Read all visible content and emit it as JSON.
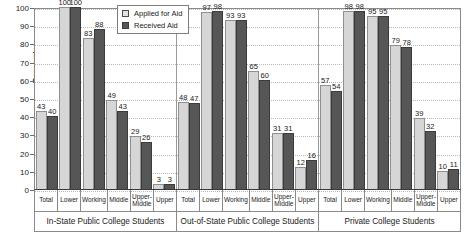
{
  "chart_data": {
    "type": "bar",
    "title": "",
    "xlabel": "",
    "ylabel": "Percent",
    "ylim": [
      0,
      100
    ],
    "ytick_labels": [
      "100",
      "90",
      "80",
      "70",
      "60",
      "50",
      "40",
      "30",
      "20",
      "10",
      "0"
    ],
    "ytick_values": [
      100,
      90,
      80,
      70,
      60,
      50,
      40,
      30,
      20,
      10,
      0
    ],
    "grid": true,
    "legend_position": "top-center",
    "legend": [
      "Applied for Aid",
      "Received Aid"
    ],
    "colors": {
      "applied": "#d6d6d6",
      "received": "#565656",
      "grid": "#b9b9b9",
      "axis": "#3a3a3a"
    },
    "categories": [
      "Total",
      "Lower",
      "Working",
      "Middle",
      "Upper-Middle",
      "Upper"
    ],
    "groups": [
      {
        "name": "In-State Public College Students",
        "series": [
          {
            "name": "Applied for Aid",
            "values": [
              43,
              100,
              83,
              49,
              29,
              3
            ]
          },
          {
            "name": "Received Aid",
            "values": [
              40,
              100,
              88,
              43,
              26,
              3
            ]
          }
        ]
      },
      {
        "name": "Out-of-State Public College Students",
        "series": [
          {
            "name": "Applied for Aid",
            "values": [
              48,
              97,
              93,
              65,
              31,
              12
            ]
          },
          {
            "name": "Received Aid",
            "values": [
              47,
              98,
              93,
              60,
              31,
              16
            ]
          }
        ]
      },
      {
        "name": "Private College Students",
        "series": [
          {
            "name": "Applied for Aid",
            "values": [
              57,
              98,
              95,
              79,
              39,
              10
            ]
          },
          {
            "name": "Received Aid",
            "values": [
              54,
              98,
              95,
              78,
              32,
              11
            ]
          }
        ]
      }
    ]
  }
}
